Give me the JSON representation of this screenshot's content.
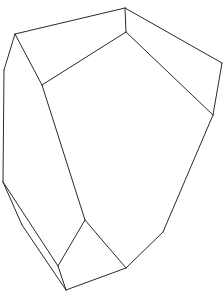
{
  "diagram": {
    "type": "polyhedron-line-drawing",
    "stroke_color": "#2a2a2a",
    "background": "#ffffff",
    "vertices": {
      "A": [
        15,
        34
      ],
      "B": [
        125,
        8
      ],
      "C": [
        222,
        63
      ],
      "D": [
        213,
        115
      ],
      "E": [
        126,
        32
      ],
      "F": [
        42,
        85
      ],
      "G": [
        4,
        70
      ],
      "H": [
        3,
        182
      ],
      "I": [
        22,
        225
      ],
      "J": [
        66,
        290
      ],
      "K": [
        58,
        266
      ],
      "L": [
        85,
        220
      ],
      "M": [
        126,
        268
      ],
      "N": [
        163,
        232
      ]
    },
    "edges": [
      [
        "A",
        "B"
      ],
      [
        "B",
        "C"
      ],
      [
        "C",
        "D"
      ],
      [
        "B",
        "E"
      ],
      [
        "E",
        "F"
      ],
      [
        "A",
        "F"
      ],
      [
        "E",
        "D"
      ],
      [
        "A",
        "G"
      ],
      [
        "G",
        "H"
      ],
      [
        "H",
        "I"
      ],
      [
        "I",
        "J"
      ],
      [
        "H",
        "K"
      ],
      [
        "K",
        "J"
      ],
      [
        "K",
        "L"
      ],
      [
        "F",
        "L"
      ],
      [
        "L",
        "M"
      ],
      [
        "J",
        "M"
      ],
      [
        "M",
        "N"
      ],
      [
        "N",
        "D"
      ]
    ]
  }
}
